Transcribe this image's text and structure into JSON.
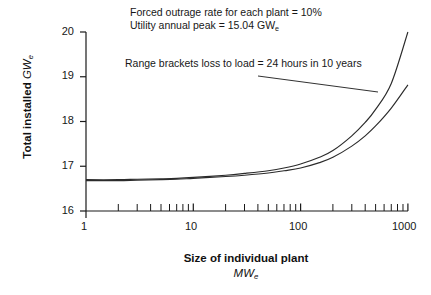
{
  "chart_data": {
    "type": "line",
    "title": "",
    "xlabel": "Size of individual plant",
    "xunit": "MWe",
    "ylabel": "Total installed",
    "yunit": "GWe",
    "xscale": "log",
    "xlim": [
      1,
      1000
    ],
    "ylim": [
      16,
      20
    ],
    "grid": false,
    "legend_position": "none",
    "x_ticks_major": [
      "1",
      "10",
      "100",
      "1000"
    ],
    "x_ticks_minor": [
      2,
      3,
      4,
      5,
      6,
      7,
      8,
      9,
      20,
      30,
      40,
      50,
      60,
      70,
      80,
      90,
      200,
      300,
      400,
      500,
      600,
      700,
      800,
      900
    ],
    "y_ticks": [
      "16",
      "17",
      "18",
      "19",
      "20"
    ],
    "annotations": [
      "Forced outrage rate for each plant = 10%",
      "Utility annual peak = 15.04 GWe",
      "Range brackets loss to load = 24 hours in 10 years"
    ],
    "series": [
      {
        "name": "upper-bound",
        "x": [
          1,
          2,
          3,
          5,
          7,
          10,
          20,
          30,
          50,
          70,
          100,
          150,
          200,
          300,
          400,
          500,
          700,
          1000
        ],
        "values": [
          16.7,
          16.7,
          16.71,
          16.72,
          16.73,
          16.75,
          16.8,
          16.84,
          16.9,
          16.96,
          17.05,
          17.2,
          17.35,
          17.68,
          17.98,
          18.27,
          18.85,
          20.0
        ]
      },
      {
        "name": "lower-bound",
        "x": [
          1,
          2,
          3,
          5,
          7,
          10,
          20,
          30,
          50,
          70,
          100,
          150,
          200,
          300,
          400,
          500,
          700,
          1000
        ],
        "values": [
          16.68,
          16.68,
          16.69,
          16.7,
          16.71,
          16.73,
          16.77,
          16.8,
          16.85,
          16.9,
          16.96,
          17.08,
          17.2,
          17.45,
          17.68,
          17.9,
          18.3,
          18.82
        ]
      }
    ]
  },
  "labels": {
    "ann_forced": "Forced outrage rate for each plant = 10%",
    "ann_utility_prefix": "Utility annual peak = 15.04 GW",
    "ann_utility_sub": "e",
    "ann_range": "Range brackets loss to load = 24 hours in 10 years",
    "y_title_main": "Total installed",
    "y_title_unit_main": "GW",
    "y_title_unit_sub": "e",
    "x_title_main": "Size of individual plant",
    "x_title_unit_main": "MW",
    "x_title_unit_sub": "e",
    "y_tick_20": "20",
    "y_tick_19": "19",
    "y_tick_18": "18",
    "y_tick_17": "17",
    "y_tick_16": "16",
    "x_tick_1": "1",
    "x_tick_10": "10",
    "x_tick_100": "100",
    "x_tick_1000": "1000"
  },
  "colors": {
    "axis": "#1a1a1a",
    "curve": "#2b2b2b",
    "background": "#ffffff",
    "text": "#171717"
  }
}
